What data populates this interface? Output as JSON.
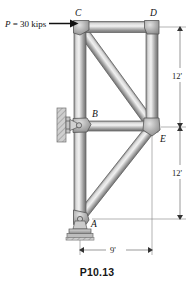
{
  "figure": {
    "caption": "P10.13",
    "load": {
      "label_p": "P",
      "label_eq": " = 30 kips",
      "full_label": "P = 30 kips",
      "magnitude": 30,
      "units": "kips",
      "direction": "right",
      "applied_at": "C"
    },
    "joints": {
      "a": "A",
      "b": "B",
      "c": "C",
      "d": "D",
      "e": "E"
    },
    "dimensions": {
      "upper_vertical": "12'",
      "lower_vertical": "12'",
      "horizontal": "9'"
    },
    "supports": {
      "wall_pin_at_b": "pin-support-b",
      "base_pin_at_a": "pin-support-a"
    },
    "members": [
      "C-D",
      "C-B",
      "B-A",
      "D-E",
      "C-E",
      "B-E",
      "A-E"
    ],
    "colors": {
      "member_light": "#e8e8e8",
      "member_mid": "#9a9a9a",
      "member_dark": "#6e6e6e",
      "outline": "#4a4a4a",
      "gusset": "#a8a8a8",
      "text": "#111111"
    }
  }
}
